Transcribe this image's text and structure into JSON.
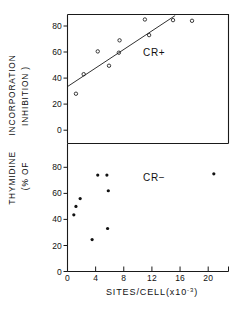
{
  "figure": {
    "yaxis_title_line1": "THYMIDINE",
    "yaxis_title_line2": "INCORPORATION",
    "yaxis_title_line3": "(% OF",
    "yaxis_title_line4": "INHIBITION )",
    "xaxis_title_main": "SITES/CELL(x10",
    "xaxis_title_exponent": "-3",
    "xaxis_title_close": ")"
  },
  "chart_data": [
    {
      "type": "scatter",
      "panel": "upper",
      "title": "",
      "series_label": "CR+",
      "marker": "open-circle",
      "xlabel": "SITES/CELL(x10-3)",
      "ylabel": "THYMIDINE INCORPORATION (% OF INHIBITION)",
      "xlim": [
        0,
        23
      ],
      "ylim": [
        0,
        90
      ],
      "xticks": [
        0,
        4,
        8,
        12,
        16,
        20
      ],
      "yticks": [
        0,
        20,
        40,
        60,
        80
      ],
      "grid": false,
      "legend": "none",
      "points": [
        {
          "x": 1.2,
          "y": 28.0
        },
        {
          "x": 2.3,
          "y": 43.0
        },
        {
          "x": 4.3,
          "y": 60.5
        },
        {
          "x": 5.9,
          "y": 49.5
        },
        {
          "x": 7.3,
          "y": 59.5
        },
        {
          "x": 7.4,
          "y": 69.0
        },
        {
          "x": 11.0,
          "y": 85.0
        },
        {
          "x": 11.6,
          "y": 73.0
        },
        {
          "x": 15.0,
          "y": 84.5
        },
        {
          "x": 17.7,
          "y": 84.0
        }
      ],
      "fit_line": {
        "x1": 0.0,
        "y1": 33.5,
        "x2": 15.3,
        "y2": 88.0
      }
    },
    {
      "type": "scatter",
      "panel": "lower",
      "title": "",
      "series_label": "CR−",
      "marker": "filled-circle",
      "xlabel": "SITES/CELL(x10-3)",
      "ylabel": "THYMIDINE INCORPORATION (% OF INHIBITION)",
      "xlim": [
        0,
        23
      ],
      "ylim": [
        0,
        90
      ],
      "xticks": [
        0,
        4,
        8,
        12,
        16,
        20
      ],
      "yticks": [
        0,
        20,
        40,
        60,
        80
      ],
      "grid": false,
      "legend": "none",
      "points": [
        {
          "x": 0.9,
          "y": 43.5
        },
        {
          "x": 1.2,
          "y": 50.0
        },
        {
          "x": 1.8,
          "y": 56.0
        },
        {
          "x": 3.5,
          "y": 24.5
        },
        {
          "x": 4.3,
          "y": 74.0
        },
        {
          "x": 5.6,
          "y": 74.0
        },
        {
          "x": 5.7,
          "y": 33.0
        },
        {
          "x": 5.8,
          "y": 62.0
        },
        {
          "x": 20.8,
          "y": 75.0
        }
      ]
    }
  ]
}
